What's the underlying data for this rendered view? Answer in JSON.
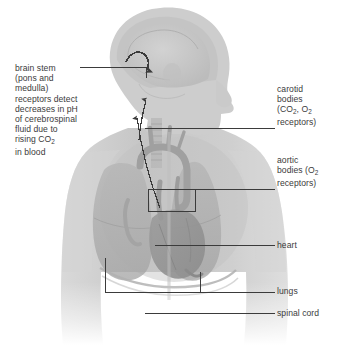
{
  "figure": {
    "type": "anatomical-diagram",
    "background_color": "#ffffff",
    "line_color": "#3b3b3b",
    "body_fill": "#c9c9c9",
    "organ_fill": "#a8a8a8"
  },
  "labels": {
    "brain_stem": {
      "lines": [
        "brain stem",
        "(pons and",
        "medulla)",
        "receptors detect",
        "decreases in pH",
        "of cerebrospinal",
        "fluid due to",
        "rising CO",
        "in blood"
      ],
      "subscript_line_index": 7,
      "subscript": "2",
      "full_text": "brain stem (pons and medulla) receptors detect decreases in pH of cerebrospinal fluid due to rising CO2 in blood"
    },
    "carotid_bodies": {
      "line1": "carotid",
      "line2": "bodies",
      "line3_pre": "(CO",
      "line3_sub": "2",
      "line3_mid": ", O",
      "line3_sub2": "2",
      "line4": "receptors)",
      "full_text": "carotid bodies (CO2, O2 receptors)"
    },
    "aortic_bodies": {
      "line1": "aortic",
      "line2_pre": "bodies (O",
      "line2_sub": "2",
      "line3": "receptors)",
      "full_text": "aortic bodies (O2 receptors)"
    },
    "heart": {
      "text": "heart"
    },
    "lungs": {
      "text": "lungs"
    },
    "spinal_cord": {
      "text": "spinal cord"
    }
  }
}
